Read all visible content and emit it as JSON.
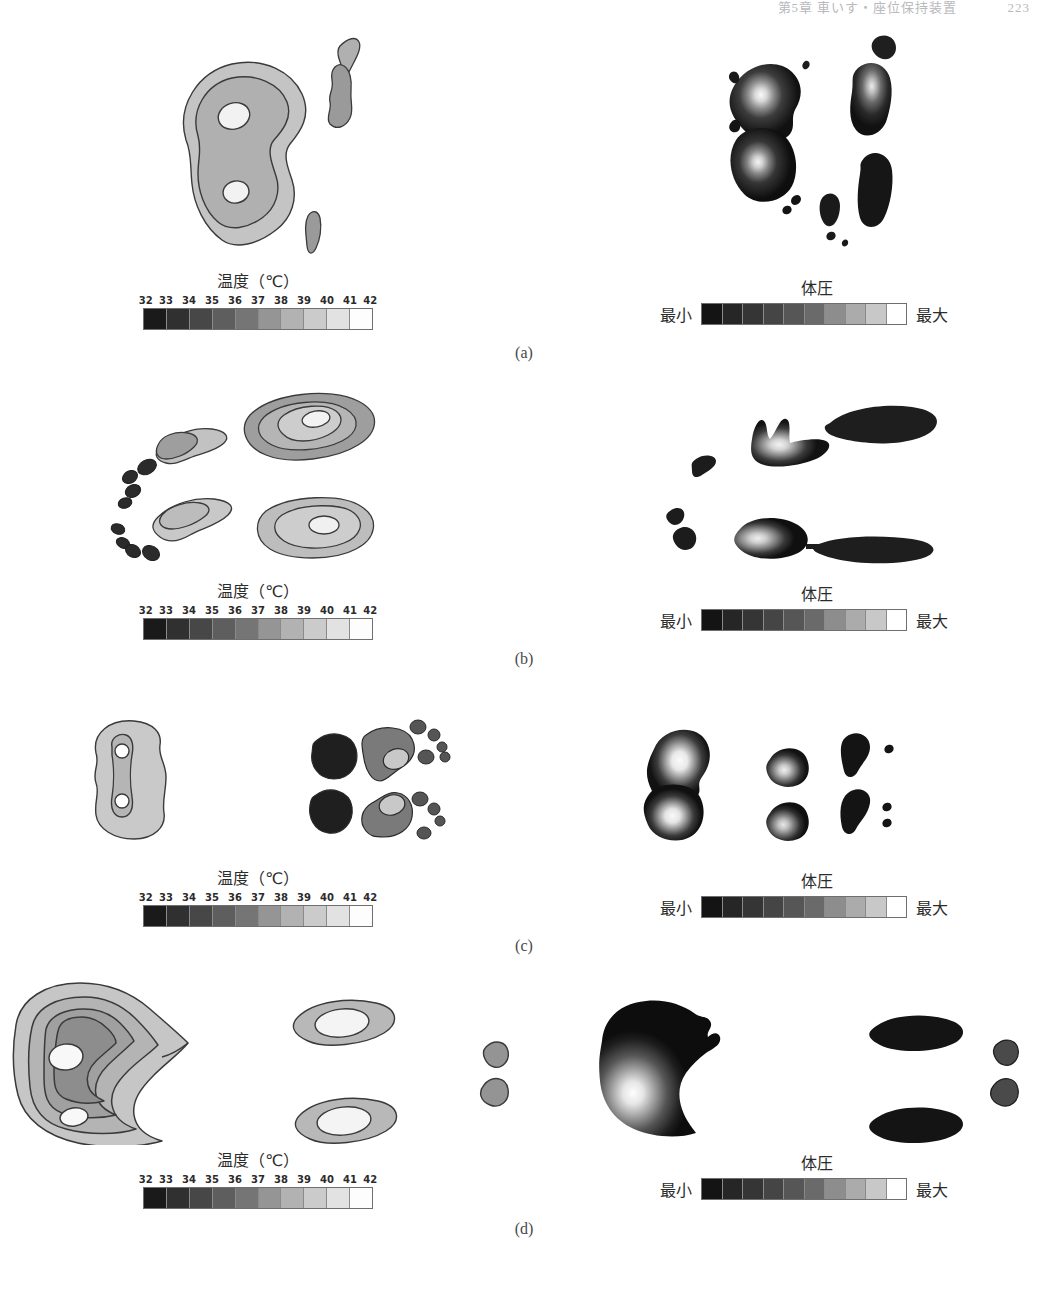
{
  "running_head": {
    "text": "第5章 車いす・座位保持装置",
    "page_number": "223"
  },
  "figure": {
    "panels": [
      {
        "label": "(a)",
        "thermal": {
          "colorbar_title": "温度（℃）",
          "ticks": [
            "32",
            "33",
            "34",
            "35",
            "36",
            "37",
            "38",
            "39",
            "40",
            "41",
            "42"
          ]
        },
        "pressure": {
          "colorbar_title": "体圧",
          "min_label": "最小",
          "max_label": "最大"
        }
      },
      {
        "label": "(b)",
        "thermal": {
          "colorbar_title": "温度（℃）",
          "ticks": [
            "32",
            "33",
            "34",
            "35",
            "36",
            "37",
            "38",
            "39",
            "40",
            "41",
            "42"
          ]
        },
        "pressure": {
          "colorbar_title": "体圧",
          "min_label": "最小",
          "max_label": "最大"
        }
      },
      {
        "label": "(c)",
        "thermal": {
          "colorbar_title": "温度（℃）",
          "ticks": [
            "32",
            "33",
            "34",
            "35",
            "36",
            "37",
            "38",
            "39",
            "40",
            "41",
            "42"
          ]
        },
        "pressure": {
          "colorbar_title": "体圧",
          "min_label": "最小",
          "max_label": "最大"
        }
      },
      {
        "label": "(d)",
        "thermal": {
          "colorbar_title": "温度（℃）",
          "ticks": [
            "32",
            "33",
            "34",
            "35",
            "36",
            "37",
            "38",
            "39",
            "40",
            "41",
            "42"
          ]
        },
        "pressure": {
          "colorbar_title": "体圧",
          "min_label": "最小",
          "max_label": "最大"
        }
      }
    ],
    "temperature_scale_colors": [
      "#1a1a1a",
      "#303030",
      "#474747",
      "#5e5e5e",
      "#757575",
      "#959595",
      "#b2b2b2",
      "#cbcbcb",
      "#e2e2e2",
      "#fdfdfd"
    ],
    "pressure_scale_colors": [
      "#141414",
      "#262626",
      "#353535",
      "#454545",
      "#565656",
      "#6a6a6a",
      "#8d8d8d",
      "#ababab",
      "#c8c8c8",
      "#ffffff"
    ],
    "contour_fill_colors": {
      "level1_outer": "#c9c9c9",
      "level2": "#b5b5b5",
      "level3": "#9e9e9e",
      "level4": "#8a8a8a",
      "level5_core": "#f4f4f4",
      "dark_spot": "#2b2b2b",
      "outline": "#3a3a3a"
    }
  }
}
